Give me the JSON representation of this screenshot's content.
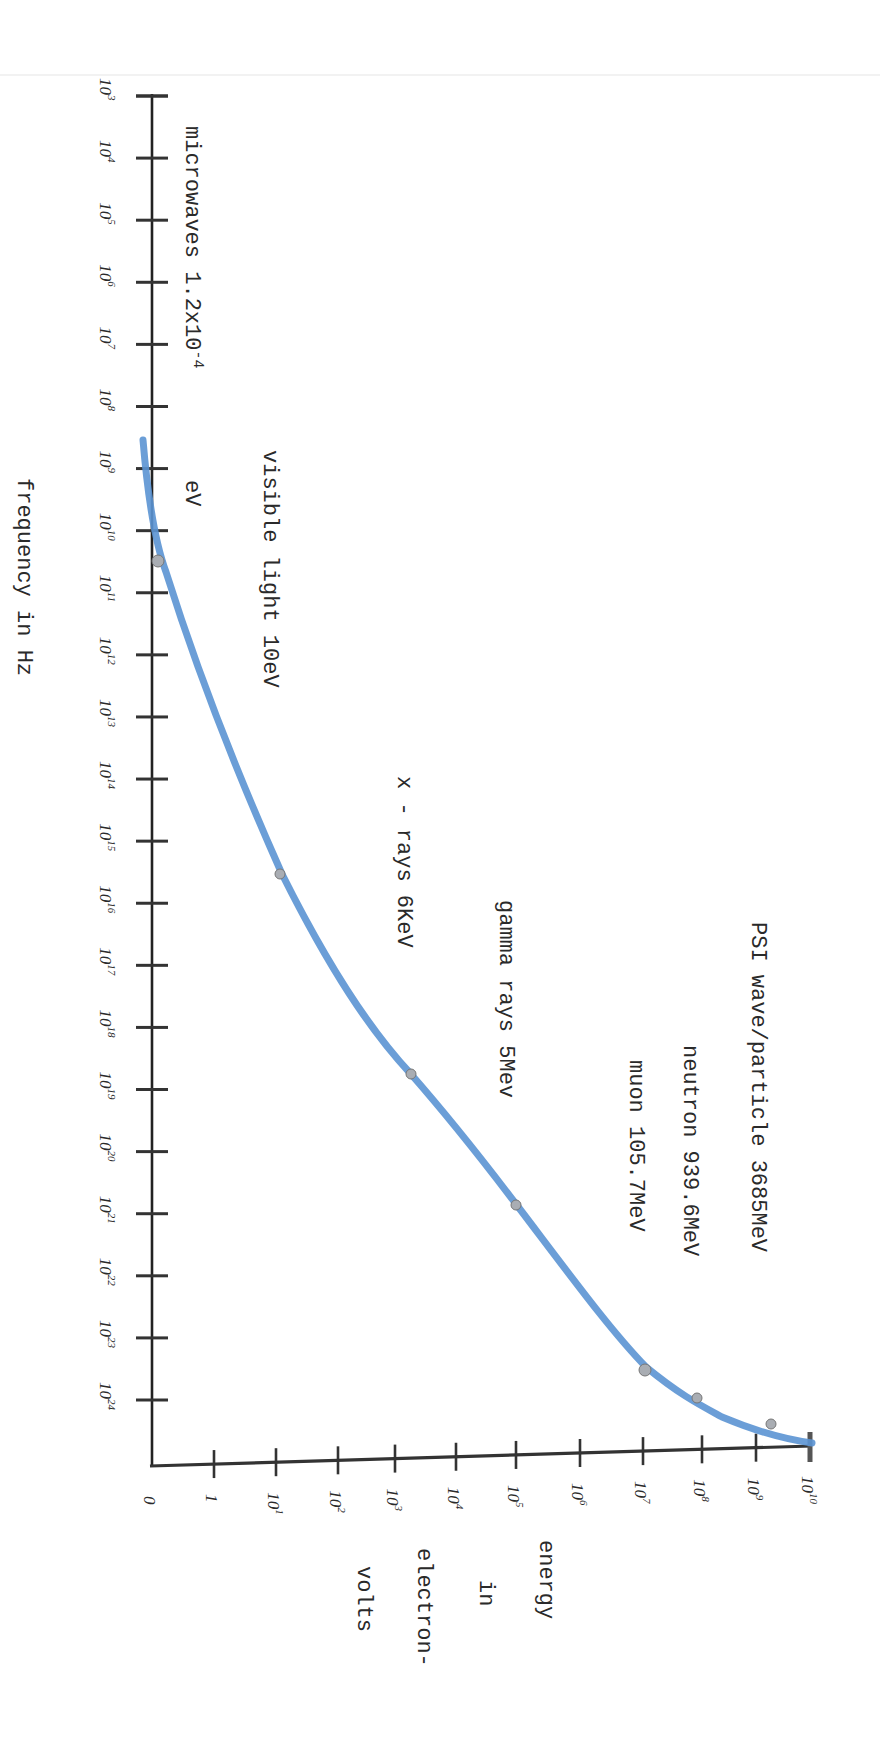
{
  "chart_data": {
    "type": "line",
    "title": "",
    "orientation": "rotated 90 degrees clockwise (frequency axis vertical on left, energy axis horizontal at bottom)",
    "xlabel": "frequency in Hz",
    "ylabel": "energy in electron-volts",
    "x_scale": "log",
    "y_scale": "log",
    "x_ticks": [
      "10^3",
      "10^4",
      "10^5",
      "10^6",
      "10^7",
      "10^8",
      "10^9",
      "10^10",
      "10^11",
      "10^12",
      "10^13",
      "10^14",
      "10^15",
      "10^16",
      "10^17",
      "10^18",
      "10^19",
      "10^20",
      "10^21",
      "10^22",
      "10^23",
      "10^24"
    ],
    "y_ticks": [
      "0",
      "1",
      "10^1",
      "10^2",
      "10^3",
      "10^4",
      "10^5",
      "10^6",
      "10^7",
      "10^8",
      "10^9",
      "10^10"
    ],
    "grid": false,
    "legend": null,
    "series": [
      {
        "name": "energy vs frequency curve",
        "color": "#5b93d3",
        "points": [
          {
            "label": "microwaves 1.2x10^-4 eV",
            "frequency": "10^10",
            "energy": "0"
          },
          {
            "label": "visible light 10eV",
            "frequency": "10^15",
            "energy": "10^1"
          },
          {
            "label": "x - rays 6KeV",
            "frequency": "10^18",
            "energy": "10^3"
          },
          {
            "label": "gamma rays 5Mev",
            "frequency": "10^20",
            "energy": "10^5"
          },
          {
            "label": "muon 105.7MeV",
            "frequency": "10^22",
            "energy": "10^7"
          },
          {
            "label": "neutron 939.6MeV",
            "frequency": "10^23",
            "energy": "10^8"
          },
          {
            "label": "PSI wave/particle 3685MeV",
            "frequency": "10^24",
            "energy": "10^9"
          }
        ]
      }
    ],
    "annotations": [
      "microwaves 1.2x10^-4 eV",
      "visible light 10eV",
      "x - rays 6KeV",
      "gamma rays 5Mev",
      "muon 105.7MeV",
      "neutron 939.6MeV",
      "PSI wave/particle 3685MeV"
    ]
  },
  "labels": {
    "x_axis_title": "frequency in Hz",
    "y_axis_title_lines": [
      "energy",
      "in",
      "electron-",
      "volts"
    ],
    "annotations": {
      "microwaves": "microwaves 1.2x10",
      "microwaves_exp": "-4",
      "microwaves_unit": "eV",
      "visible": "visible light 10eV",
      "xrays": "x - rays 6KeV",
      "gamma": "gamma rays 5Mev",
      "muon": "muon 105.7MeV",
      "neutron": "neutron 939.6MeV",
      "psi": "PSI wave/particle 3685MeV"
    },
    "freq_ticks": [
      {
        "base": "10",
        "exp": "3"
      },
      {
        "base": "10",
        "exp": "4"
      },
      {
        "base": "10",
        "exp": "5"
      },
      {
        "base": "10",
        "exp": "6"
      },
      {
        "base": "10",
        "exp": "7"
      },
      {
        "base": "10",
        "exp": "8"
      },
      {
        "base": "10",
        "exp": "9"
      },
      {
        "base": "10",
        "exp": "10"
      },
      {
        "base": "10",
        "exp": "11"
      },
      {
        "base": "10",
        "exp": "12"
      },
      {
        "base": "10",
        "exp": "13"
      },
      {
        "base": "10",
        "exp": "14"
      },
      {
        "base": "10",
        "exp": "15"
      },
      {
        "base": "10",
        "exp": "16"
      },
      {
        "base": "10",
        "exp": "17"
      },
      {
        "base": "10",
        "exp": "18"
      },
      {
        "base": "10",
        "exp": "19"
      },
      {
        "base": "10",
        "exp": "20"
      },
      {
        "base": "10",
        "exp": "21"
      },
      {
        "base": "10",
        "exp": "22"
      },
      {
        "base": "10",
        "exp": "23"
      },
      {
        "base": "10",
        "exp": "24"
      }
    ],
    "energy_ticks": [
      {
        "base": "0",
        "exp": ""
      },
      {
        "base": "1",
        "exp": ""
      },
      {
        "base": "10",
        "exp": "1"
      },
      {
        "base": "10",
        "exp": "2"
      },
      {
        "base": "10",
        "exp": "3"
      },
      {
        "base": "10",
        "exp": "4"
      },
      {
        "base": "10",
        "exp": "5"
      },
      {
        "base": "10",
        "exp": "6"
      },
      {
        "base": "10",
        "exp": "7"
      },
      {
        "base": "10",
        "exp": "8"
      },
      {
        "base": "10",
        "exp": "9"
      },
      {
        "base": "10",
        "exp": "10"
      }
    ]
  },
  "colors": {
    "curve": "#5b93d3",
    "axis": "#222222",
    "marker": "#a9adb3",
    "text": "#2a2a2a"
  }
}
